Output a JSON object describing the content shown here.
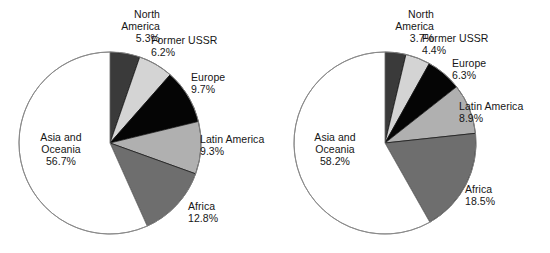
{
  "figure": {
    "background": "#ffffff",
    "charts": [
      {
        "id": "left",
        "center": {
          "x": 110,
          "y": 143
        },
        "radius": 91,
        "slices": [
          {
            "label": "North America",
            "pct_text": "5.3%",
            "value": 5.3,
            "color": "#3a3a3a"
          },
          {
            "label": "Former USSR",
            "pct_text": "6.2%",
            "value": 6.2,
            "color": "#d4d4d4"
          },
          {
            "label": "Europe",
            "pct_text": "9.7%",
            "value": 9.7,
            "color": "#050505"
          },
          {
            "label": "Latin America",
            "pct_text": "9.3%",
            "value": 9.3,
            "color": "#b0b0b0"
          },
          {
            "label": "Africa",
            "pct_text": "12.8%",
            "value": 12.8,
            "color": "#6e6e6e"
          },
          {
            "label": "Asia and Oceania",
            "pct_text": "56.7%",
            "value": 56.7,
            "color": "#ffffff"
          }
        ],
        "labels": [
          {
            "name": "North",
            "name2": "America",
            "pct": "5.3%",
            "x": 88,
            "y": 8,
            "align": "right",
            "w": 72
          },
          {
            "name": "Former USSR",
            "pct": "6.2%",
            "x": 151,
            "y": 34,
            "align": "left",
            "w": 90
          },
          {
            "name": "Europe",
            "pct": "9.7%",
            "x": 191,
            "y": 71,
            "align": "left",
            "w": 70
          },
          {
            "name": "Latin America",
            "pct": "9.3%",
            "x": 200,
            "y": 133,
            "align": "left",
            "w": 78
          },
          {
            "name": "Africa",
            "pct": "12.8%",
            "x": 188,
            "y": 200,
            "align": "left",
            "w": 60
          },
          {
            "name": "Asia and",
            "name2": "Oceania",
            "pct": "56.7%",
            "x": 24,
            "y": 131,
            "align": "center",
            "w": 74
          }
        ]
      },
      {
        "id": "right",
        "center": {
          "x": 385,
          "y": 143
        },
        "radius": 91,
        "slices": [
          {
            "label": "North America",
            "pct_text": "3.7%",
            "value": 3.7,
            "color": "#3a3a3a"
          },
          {
            "label": "Former USSR",
            "pct_text": "4.4%",
            "value": 4.4,
            "color": "#d4d4d4"
          },
          {
            "label": "Europe",
            "pct_text": "6.3%",
            "value": 6.3,
            "color": "#050505"
          },
          {
            "label": "Latin America",
            "pct_text": "8.9%",
            "value": 8.9,
            "color": "#b0b0b0"
          },
          {
            "label": "Africa",
            "pct_text": "18.5%",
            "value": 18.5,
            "color": "#6e6e6e"
          },
          {
            "label": "Asia and Oceania",
            "pct_text": "58.2%",
            "value": 58.2,
            "color": "#ffffff"
          }
        ],
        "labels": [
          {
            "name": "North",
            "name2": "America",
            "pct": "3.7%",
            "x": 362,
            "y": 8,
            "align": "right",
            "w": 72
          },
          {
            "name": "Former USSR",
            "pct": "4.4%",
            "x": 422,
            "y": 32,
            "align": "left",
            "w": 90
          },
          {
            "name": "Europe",
            "pct": "6.3%",
            "x": 452,
            "y": 57,
            "align": "left",
            "w": 70
          },
          {
            "name": "Latin America",
            "pct": "8.9%",
            "x": 459,
            "y": 100,
            "align": "left",
            "w": 84
          },
          {
            "name": "Africa",
            "pct": "18.5%",
            "x": 465,
            "y": 183,
            "align": "left",
            "w": 62
          },
          {
            "name": "Asia and",
            "name2": "Oceania",
            "pct": "58.2%",
            "x": 298,
            "y": 131,
            "align": "center",
            "w": 74
          }
        ]
      }
    ]
  },
  "chart_data": [
    {
      "type": "pie",
      "title": "",
      "categories": [
        "North America",
        "Former USSR",
        "Europe",
        "Latin America",
        "Africa",
        "Asia and Oceania"
      ],
      "values": [
        5.3,
        6.2,
        9.7,
        9.3,
        12.8,
        56.7
      ],
      "unit": "percent",
      "start_angle_deg": 0,
      "direction": "clockwise",
      "legend": "none",
      "data_labels": [
        "5.3%",
        "6.2%",
        "9.7%",
        "9.3%",
        "12.8%",
        "56.7%"
      ],
      "colors": [
        "#3a3a3a",
        "#d4d4d4",
        "#050505",
        "#b0b0b0",
        "#6e6e6e",
        "#ffffff"
      ]
    },
    {
      "type": "pie",
      "title": "",
      "categories": [
        "North America",
        "Former USSR",
        "Europe",
        "Latin America",
        "Africa",
        "Asia and Oceania"
      ],
      "values": [
        3.7,
        4.4,
        6.3,
        8.9,
        18.5,
        58.2
      ],
      "unit": "percent",
      "start_angle_deg": 0,
      "direction": "clockwise",
      "legend": "none",
      "data_labels": [
        "3.7%",
        "4.4%",
        "6.3%",
        "8.9%",
        "18.5%",
        "58.2%"
      ],
      "colors": [
        "#3a3a3a",
        "#d4d4d4",
        "#050505",
        "#b0b0b0",
        "#6e6e6e",
        "#ffffff"
      ]
    }
  ]
}
